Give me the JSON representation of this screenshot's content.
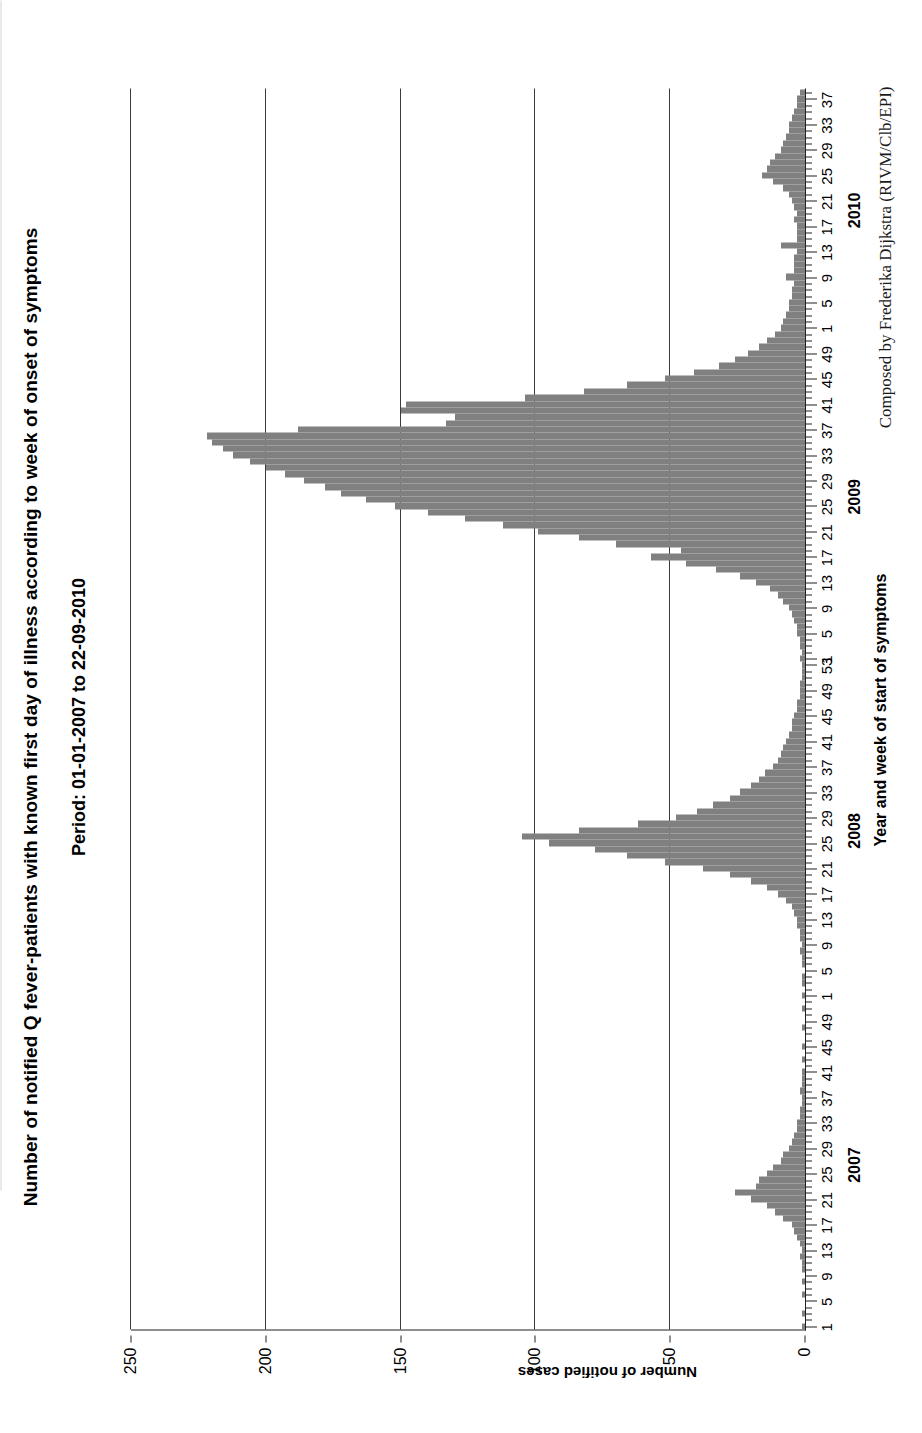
{
  "figure": {
    "title": "Number of notified Q fever-patients with known first day of illness according to week of onset of symptoms",
    "subtitle": "Period: 01-01-2007 to 22-09-2010",
    "credit": "Composed by Frederika Dijkstra (RIVM/Clb/EPI)",
    "bar_color": "#808080",
    "axis_color": "#231f20"
  },
  "chart_data": {
    "type": "bar",
    "title": "Number of notified Q fever-patients with known first day of illness according to week of onset of symptoms",
    "subtitle": "Period: 01-01-2007 to 22-09-2010",
    "xlabel": "Year and week of start of symptoms",
    "ylabel": "Number of notified cases",
    "ylim": [
      0,
      250
    ],
    "ytick_labels": [
      "0",
      "50",
      "100",
      "150",
      "200",
      "250"
    ],
    "yticks": [
      0,
      50,
      100,
      150,
      200,
      250
    ],
    "grid": "vertical gridlines at 50, 100, 150, 200, 250",
    "legend": "none",
    "week_tick_labels": [
      "1",
      "5",
      "9",
      "13",
      "17",
      "21",
      "25",
      "29",
      "33",
      "37",
      "41",
      "45",
      "49",
      "53"
    ],
    "year_groups": [
      {
        "year": "2007",
        "weeks": 52
      },
      {
        "year": "2008",
        "weeks": 53
      },
      {
        "year": "2009",
        "weeks": 52
      },
      {
        "year": "2010",
        "weeks": 38
      }
    ],
    "categories": [
      "2007-w1",
      "2007-w2",
      "2007-w3",
      "2007-w4",
      "2007-w5",
      "2007-w6",
      "2007-w7",
      "2007-w8",
      "2007-w9",
      "2007-w10",
      "2007-w11",
      "2007-w12",
      "2007-w13",
      "2007-w14",
      "2007-w15",
      "2007-w16",
      "2007-w17",
      "2007-w18",
      "2007-w19",
      "2007-w20",
      "2007-w21",
      "2007-w22",
      "2007-w23",
      "2007-w24",
      "2007-w25",
      "2007-w26",
      "2007-w27",
      "2007-w28",
      "2007-w29",
      "2007-w30",
      "2007-w31",
      "2007-w32",
      "2007-w33",
      "2007-w34",
      "2007-w35",
      "2007-w36",
      "2007-w37",
      "2007-w38",
      "2007-w39",
      "2007-w40",
      "2007-w41",
      "2007-w42",
      "2007-w43",
      "2007-w44",
      "2007-w45",
      "2007-w46",
      "2007-w47",
      "2007-w48",
      "2007-w49",
      "2007-w50",
      "2007-w51",
      "2007-w52",
      "2008-w1",
      "2008-w2",
      "2008-w3",
      "2008-w4",
      "2008-w5",
      "2008-w6",
      "2008-w7",
      "2008-w8",
      "2008-w9",
      "2008-w10",
      "2008-w11",
      "2008-w12",
      "2008-w13",
      "2008-w14",
      "2008-w15",
      "2008-w16",
      "2008-w17",
      "2008-w18",
      "2008-w19",
      "2008-w20",
      "2008-w21",
      "2008-w22",
      "2008-w23",
      "2008-w24",
      "2008-w25",
      "2008-w26",
      "2008-w27",
      "2008-w28",
      "2008-w29",
      "2008-w30",
      "2008-w31",
      "2008-w32",
      "2008-w33",
      "2008-w34",
      "2008-w35",
      "2008-w36",
      "2008-w37",
      "2008-w38",
      "2008-w39",
      "2008-w40",
      "2008-w41",
      "2008-w42",
      "2008-w43",
      "2008-w44",
      "2008-w45",
      "2008-w46",
      "2008-w47",
      "2008-w48",
      "2008-w49",
      "2008-w50",
      "2008-w51",
      "2008-w52",
      "2008-w53",
      "2009-w1",
      "2009-w2",
      "2009-w3",
      "2009-w4",
      "2009-w5",
      "2009-w6",
      "2009-w7",
      "2009-w8",
      "2009-w9",
      "2009-w10",
      "2009-w11",
      "2009-w12",
      "2009-w13",
      "2009-w14",
      "2009-w15",
      "2009-w16",
      "2009-w17",
      "2009-w18",
      "2009-w19",
      "2009-w20",
      "2009-w21",
      "2009-w22",
      "2009-w23",
      "2009-w24",
      "2009-w25",
      "2009-w26",
      "2009-w27",
      "2009-w28",
      "2009-w29",
      "2009-w30",
      "2009-w31",
      "2009-w32",
      "2009-w33",
      "2009-w34",
      "2009-w35",
      "2009-w36",
      "2009-w37",
      "2009-w38",
      "2009-w39",
      "2009-w40",
      "2009-w41",
      "2009-w42",
      "2009-w43",
      "2009-w44",
      "2009-w45",
      "2009-w46",
      "2009-w47",
      "2009-w48",
      "2009-w49",
      "2009-w50",
      "2009-w51",
      "2009-w52",
      "2010-w1",
      "2010-w2",
      "2010-w3",
      "2010-w4",
      "2010-w5",
      "2010-w6",
      "2010-w7",
      "2010-w8",
      "2010-w9",
      "2010-w10",
      "2010-w11",
      "2010-w12",
      "2010-w13",
      "2010-w14",
      "2010-w15",
      "2010-w16",
      "2010-w17",
      "2010-w18",
      "2010-w19",
      "2010-w20",
      "2010-w21",
      "2010-w22",
      "2010-w23",
      "2010-w24",
      "2010-w25",
      "2010-w26",
      "2010-w27",
      "2010-w28",
      "2010-w29",
      "2010-w30",
      "2010-w31",
      "2010-w32",
      "2010-w33",
      "2010-w34",
      "2010-w35",
      "2010-w36",
      "2010-w37",
      "2010-w38"
    ],
    "values": [
      1,
      0,
      1,
      0,
      0,
      1,
      0,
      1,
      0,
      1,
      1,
      2,
      1,
      2,
      3,
      4,
      5,
      8,
      11,
      14,
      20,
      26,
      18,
      17,
      14,
      12,
      9,
      8,
      6,
      5,
      4,
      3,
      3,
      2,
      2,
      1,
      1,
      2,
      1,
      1,
      1,
      0,
      1,
      0,
      1,
      0,
      0,
      1,
      0,
      0,
      1,
      0,
      1,
      0,
      1,
      1,
      0,
      1,
      1,
      2,
      1,
      2,
      2,
      3,
      3,
      4,
      5,
      7,
      10,
      14,
      20,
      28,
      38,
      52,
      66,
      78,
      95,
      105,
      84,
      62,
      48,
      40,
      34,
      28,
      24,
      20,
      17,
      15,
      12,
      10,
      9,
      8,
      7,
      6,
      5,
      5,
      4,
      3,
      3,
      2,
      2,
      2,
      1,
      1,
      1,
      2,
      1,
      2,
      2,
      3,
      3,
      4,
      5,
      6,
      8,
      10,
      13,
      18,
      24,
      33,
      44,
      57,
      46,
      70,
      84,
      99,
      112,
      126,
      140,
      152,
      163,
      172,
      178,
      186,
      193,
      200,
      206,
      212,
      216,
      220,
      222,
      188,
      133,
      130,
      150,
      148,
      104,
      82,
      66,
      52,
      41,
      32,
      26,
      21,
      17,
      14,
      11,
      9,
      8,
      7,
      6,
      6,
      5,
      5,
      4,
      7,
      4,
      4,
      4,
      3,
      9,
      3,
      3,
      3,
      4,
      3,
      4,
      5,
      6,
      8,
      12,
      16,
      14,
      13,
      11,
      9,
      8,
      7,
      6,
      6,
      5,
      4,
      3,
      3,
      2
    ],
    "peaks": [
      {
        "label": "2007 peak",
        "category": "2007-w22",
        "value": 26
      },
      {
        "label": "2008 peak",
        "category": "2008-w26",
        "value": 105
      },
      {
        "label": "2009 peak",
        "category": "2009-w36",
        "value": 222
      }
    ]
  }
}
